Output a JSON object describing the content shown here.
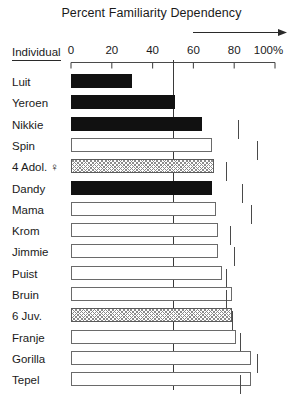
{
  "chart_data": {
    "type": "bar",
    "title": "Percent Familiarity Dependency",
    "xlabel": "",
    "ylabel": "Individual",
    "orientation": "horizontal",
    "xlim": [
      0,
      100
    ],
    "xticks": [
      0,
      20,
      40,
      60,
      80,
      100
    ],
    "xtick_labels": [
      "0",
      "20",
      "40",
      "60",
      "80",
      "100%"
    ],
    "grid": false,
    "legend": "none",
    "reference_line": 50,
    "annotations": [
      "arrow above axis pointing right from 60 to 100%"
    ],
    "categories": [
      "Luit",
      "Yeroen",
      "Nikkie",
      "Spin",
      "4 Adol. ♀",
      "Dandy",
      "Mama",
      "Krom",
      "Jimmie",
      "Puist",
      "Bruin",
      "6 Juv.",
      "Franje",
      "Gorilla",
      "Tepel"
    ],
    "values": [
      30,
      51,
      64,
      69,
      70,
      69,
      71,
      72,
      72,
      74,
      79,
      79,
      81,
      88,
      88
    ],
    "fills": [
      "solid",
      "solid",
      "solid",
      "open",
      "hatched",
      "solid",
      "open",
      "open",
      "open",
      "open",
      "open",
      "hatched",
      "open",
      "open",
      "open"
    ],
    "range_marks": [
      null,
      null,
      82,
      91,
      76,
      84,
      88,
      78,
      80,
      76,
      76,
      79,
      83,
      91,
      83
    ]
  },
  "axis": {
    "individual_label": "Individual"
  }
}
